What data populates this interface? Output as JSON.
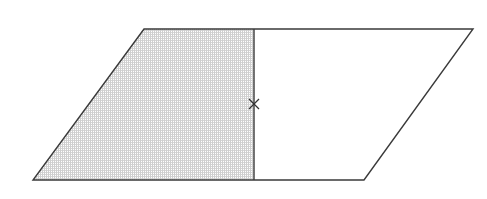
{
  "diagram": {
    "type": "parallelogram-divided",
    "parallelogram": {
      "vertices": {
        "top_left": [
          144,
          29
        ],
        "top_right": [
          473,
          29
        ],
        "bottom_right": [
          364,
          180
        ],
        "bottom_left": [
          33,
          180
        ]
      },
      "stroke": "#3a3a3a",
      "stroke_width": 1.4,
      "fill": "#ffffff"
    },
    "divider": {
      "x": 254,
      "y_top": 29,
      "y_bottom": 180,
      "stroke": "#3a3a3a",
      "stroke_width": 1.4
    },
    "shaded_region": {
      "vertices": [
        [
          144,
          29
        ],
        [
          254,
          29
        ],
        [
          254,
          180
        ],
        [
          33,
          180
        ]
      ],
      "pattern_color": "#c9c9c9",
      "pattern_spacing": 2
    },
    "marker": {
      "symbol": "cross",
      "center": [
        254,
        104
      ],
      "size": 5,
      "stroke": "#333333",
      "stroke_width": 1.2
    }
  }
}
